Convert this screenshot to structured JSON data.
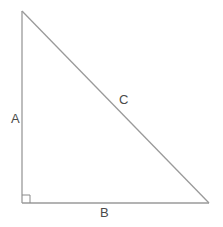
{
  "diagram": {
    "type": "right-triangle",
    "colors": {
      "stroke": "#9a9a9a",
      "label": "#4a4a4a",
      "background": "#ffffff"
    },
    "vertices": {
      "top": [
        22,
        11
      ],
      "right_angle": [
        22,
        203
      ],
      "right": [
        209,
        203
      ]
    },
    "right_angle_marker_size": 8,
    "labels": {
      "side_a": "A",
      "side_b": "B",
      "side_c": "C"
    }
  }
}
